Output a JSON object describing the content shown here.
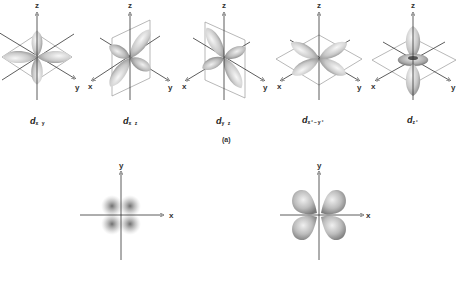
{
  "figure": {
    "part_a_caption": "(a)",
    "orbitals": [
      {
        "id": "dxy",
        "symbol": "d",
        "subscript": "x y",
        "axes": {
          "z": "z",
          "y": "y"
        }
      },
      {
        "id": "dxz",
        "symbol": "d",
        "subscript": "x z",
        "axes": {
          "x": "x",
          "z": "z",
          "y": "y"
        }
      },
      {
        "id": "dyz",
        "symbol": "d",
        "subscript": "y z",
        "axes": {
          "x": "x",
          "z": "z",
          "y": "y"
        }
      },
      {
        "id": "dx2-y2",
        "symbol": "d",
        "subscript": "x²−y²",
        "axes": {
          "x": "x",
          "z": "z",
          "y": "y"
        }
      },
      {
        "id": "dz2",
        "symbol": "d",
        "subscript": "z²",
        "axes": {
          "x": "x",
          "z": "z",
          "y": "y"
        }
      }
    ],
    "cross_sections": [
      {
        "id": "density-plot",
        "style": "diffuse electron density",
        "axes": {
          "x": "x",
          "y": "y"
        }
      },
      {
        "id": "boundary-plot",
        "style": "shaded four-lobe boundary surface",
        "axes": {
          "x": "x",
          "y": "y"
        }
      }
    ],
    "colors": {
      "background": "#ffffff",
      "axis": "#333333",
      "lobe_light": "#f2f2f2",
      "lobe_dark": "#8a8a8a",
      "plane": "#9a9a9a"
    }
  }
}
